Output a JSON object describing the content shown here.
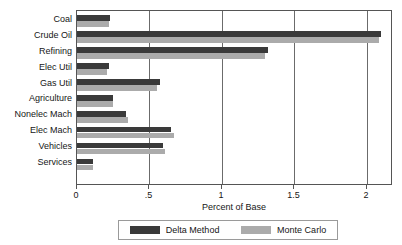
{
  "chart_data": {
    "type": "bar",
    "orientation": "horizontal",
    "title": "",
    "xlabel": "Percent of Base",
    "ylabel": "",
    "xlim": [
      0,
      2.18
    ],
    "xticks": [
      0,
      0.5,
      1,
      1.5,
      2
    ],
    "xticklabels": [
      "0",
      ".5",
      "1",
      "1.5",
      "2"
    ],
    "grid": "vertical",
    "legend_position": "bottom",
    "categories": [
      "Coal",
      "Crude Oil",
      "Refining",
      "Elec Util",
      "Gas Util",
      "Agriculture",
      "Nonelec Mach",
      "Elec Mach",
      "Vehicles",
      "Services"
    ],
    "series": [
      {
        "name": "Delta Method",
        "color": "#3a3a3a",
        "values": [
          0.23,
          2.1,
          1.32,
          0.22,
          0.57,
          0.25,
          0.34,
          0.65,
          0.59,
          0.11
        ]
      },
      {
        "name": "Monte Carlo",
        "color": "#ababab",
        "values": [
          0.22,
          2.08,
          1.3,
          0.21,
          0.55,
          0.25,
          0.35,
          0.67,
          0.61,
          0.11
        ]
      }
    ]
  },
  "legend": {
    "entries": [
      {
        "label": "Delta Method"
      },
      {
        "label": "Monte Carlo"
      }
    ]
  },
  "axis": {
    "x_title": "Percent of Base"
  }
}
